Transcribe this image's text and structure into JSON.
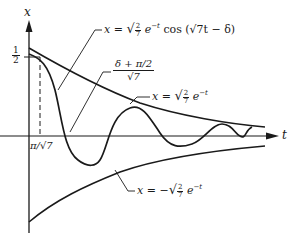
{
  "figure": {
    "axes": {
      "x_axis_label": "t",
      "y_axis_label": "x",
      "y_tick_label_num": "1",
      "y_tick_label_den": "2",
      "x_tick_label": "π/√7"
    },
    "annotations": {
      "curve_label": {
        "lhs": "x = ",
        "frac_num": "2",
        "frac_den": "7",
        "exp_base": "e",
        "exp": "−t",
        "tail": " cos (√7t − δ)"
      },
      "upper_envelope_label": {
        "lhs": "x = ",
        "frac_num": "2",
        "frac_den": "7",
        "exp_base": "e",
        "exp": "−t"
      },
      "lower_envelope_label": {
        "lhs": "x = −",
        "frac_num": "2",
        "frac_den": "7",
        "exp_base": "e",
        "exp": "−t"
      },
      "crossing_label": {
        "numerator": "δ + π/2",
        "denominator": "√7"
      }
    },
    "colors": {
      "ink": "#1a1a1a",
      "background": "#ffffff"
    }
  }
}
